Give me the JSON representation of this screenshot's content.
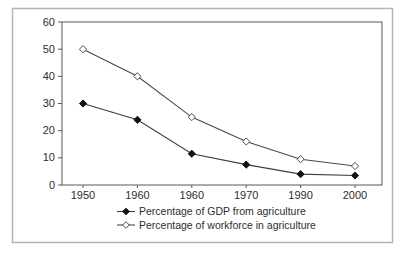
{
  "figure": {
    "background": "#ffffff",
    "frame_color": "#b5b5b9",
    "plot_border_color": "#59595b",
    "text_color": "#2d2d2f"
  },
  "chart_data": {
    "type": "line",
    "title": "",
    "xlabel": "",
    "ylabel": "Per cent",
    "categories": [
      "1950",
      "1960",
      "1960",
      "1970",
      "1990",
      "2000"
    ],
    "y_ticks": [
      0,
      10,
      20,
      30,
      40,
      50,
      60
    ],
    "ylim": [
      0,
      60
    ],
    "grid": false,
    "legend_position": "bottom-center",
    "series": [
      {
        "name": "Percentage of GDP from agriculture",
        "marker": "filled-diamond",
        "line_color": "#3f3f41",
        "marker_fill": "#121212",
        "marker_stroke": "#121212",
        "values": [
          30,
          24,
          11.5,
          7.5,
          4,
          3.5
        ]
      },
      {
        "name": "Percentage of workforce in agriculture",
        "marker": "open-diamond",
        "line_color": "#4a4a4c",
        "marker_fill": "#ffffff",
        "marker_stroke": "#4a4a4c",
        "values": [
          50,
          40,
          25,
          16,
          9.5,
          7
        ]
      }
    ]
  }
}
